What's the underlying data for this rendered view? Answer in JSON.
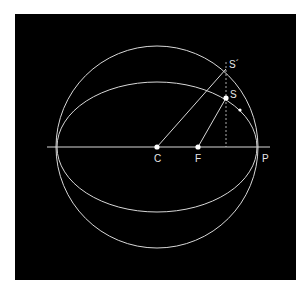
{
  "diagram": {
    "colors": {
      "background": "#000000",
      "stroke": "#d8d8d8",
      "points": "#ffffff",
      "page": "#ffffff"
    },
    "labels": {
      "center": "C",
      "focus": "F",
      "perihelion": "P",
      "planet": "S",
      "auxiliary_point": "S´"
    },
    "geometry": {
      "center": [
        157,
        147
      ],
      "focus": [
        198,
        147
      ],
      "planet": [
        226,
        98
      ],
      "auxiliary_point": [
        226,
        69
      ],
      "motion_marker": [
        240,
        110
      ],
      "circle_radius": 101,
      "ellipse_rx": 100,
      "ellipse_ry": 65,
      "axis_from": [
        47,
        147
      ],
      "axis_to": [
        270,
        147
      ]
    }
  }
}
